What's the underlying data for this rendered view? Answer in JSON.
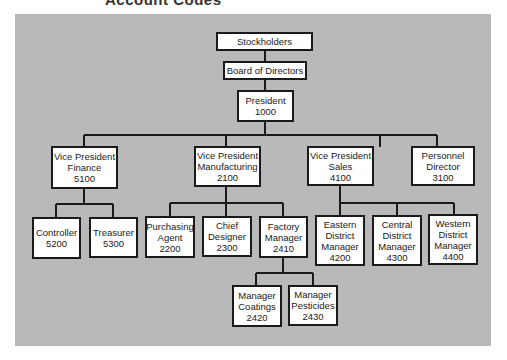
{
  "title": "Account Codes",
  "colors": {
    "panel": "#b9b9b9",
    "box": "#ffffff",
    "line": "#1a1a1a"
  },
  "nodes": {
    "stockholders": {
      "lines": [
        "Stockholders"
      ]
    },
    "board": {
      "lines": [
        "Board of Directors"
      ]
    },
    "president": {
      "lines": [
        "President",
        "1000"
      ]
    },
    "vp_finance": {
      "lines": [
        "Vice President",
        "Finance",
        "5100"
      ]
    },
    "vp_manufacturing": {
      "lines": [
        "Vice President",
        "Manufacturing",
        "2100"
      ]
    },
    "vp_sales": {
      "lines": [
        "Vice President",
        "Sales",
        "4100"
      ]
    },
    "personnel_director": {
      "lines": [
        "Personnel",
        "Director",
        "3100"
      ]
    },
    "controller": {
      "lines": [
        "Controller",
        "5200"
      ]
    },
    "treasurer": {
      "lines": [
        "Treasurer",
        "5300"
      ]
    },
    "purchasing_agent": {
      "lines": [
        "Purchasing",
        "Agent",
        "2200"
      ]
    },
    "chief_designer": {
      "lines": [
        "Chief",
        "Designer",
        "2300"
      ]
    },
    "factory_manager": {
      "lines": [
        "Factory",
        "Manager",
        "2410"
      ]
    },
    "eastern_district_manager": {
      "lines": [
        "Eastern",
        "District",
        "Manager",
        "4200"
      ]
    },
    "central_district_manager": {
      "lines": [
        "Central",
        "District",
        "Manager",
        "4300"
      ]
    },
    "western_district_manager": {
      "lines": [
        "Western",
        "District",
        "Manager",
        "4400"
      ]
    },
    "manager_coatings": {
      "lines": [
        "Manager",
        "Coatings",
        "2420"
      ]
    },
    "manager_pesticides": {
      "lines": [
        "Manager",
        "Pesticides",
        "2430"
      ]
    }
  }
}
